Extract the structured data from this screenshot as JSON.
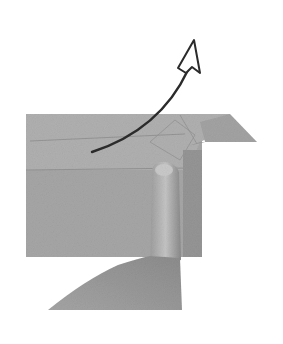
{
  "image": {
    "description": "Origami instruction photo: a finger holds down a folded grey paper while a curved arrow indicates folding the top flap upward and back",
    "colors": {
      "background": "#ffffff",
      "paper": "#a9a9a9",
      "paper_dark": "#8f8f8f",
      "paper_light": "#bdbdbd",
      "hand": "#b3b3b3",
      "arrow": "#2b2b2b"
    }
  }
}
